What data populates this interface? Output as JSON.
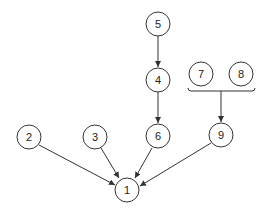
{
  "diagram": {
    "type": "dependency-graph",
    "nodes": [
      {
        "id": "1",
        "label": "1",
        "x": 127,
        "y": 190
      },
      {
        "id": "2",
        "label": "2",
        "x": 29,
        "y": 137
      },
      {
        "id": "3",
        "label": "3",
        "x": 95,
        "y": 137
      },
      {
        "id": "4",
        "label": "4",
        "x": 158,
        "y": 80
      },
      {
        "id": "5",
        "label": "5",
        "x": 158,
        "y": 24
      },
      {
        "id": "6",
        "label": "6",
        "x": 158,
        "y": 136
      },
      {
        "id": "7",
        "label": "7",
        "x": 201,
        "y": 74
      },
      {
        "id": "8",
        "label": "8",
        "x": 241,
        "y": 74
      },
      {
        "id": "9",
        "label": "9",
        "x": 221,
        "y": 135
      }
    ],
    "edges": [
      {
        "from": "5",
        "to": "4"
      },
      {
        "from": "4",
        "to": "6"
      },
      {
        "from": "2",
        "to": "1"
      },
      {
        "from": "3",
        "to": "1"
      },
      {
        "from": "6",
        "to": "1"
      },
      {
        "from": "9",
        "to": "1"
      },
      {
        "from": [
          "7",
          "8"
        ],
        "to": "9",
        "style": "bracket-join"
      }
    ]
  }
}
